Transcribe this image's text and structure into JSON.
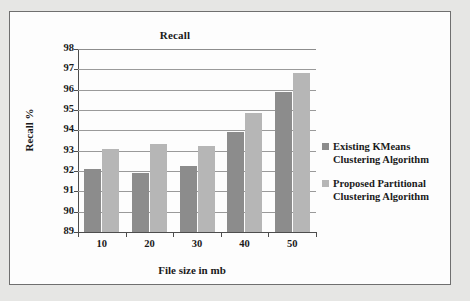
{
  "chart_data": {
    "type": "bar",
    "title": "Recall",
    "xlabel": "File size in mb",
    "ylabel": "Recall %",
    "categories": [
      "10",
      "20",
      "30",
      "40",
      "50"
    ],
    "ylim": [
      89,
      98
    ],
    "yticks": [
      "98",
      "97",
      "96",
      "95",
      "94",
      "93",
      "92",
      "91",
      "90",
      "89"
    ],
    "grid": true,
    "legend_position": "right",
    "series": [
      {
        "name": "Existing KMeans Clustering Algorithm",
        "color": "#8c8c8c",
        "values": [
          92.1,
          91.9,
          92.25,
          93.9,
          95.9
        ]
      },
      {
        "name": "Proposed Partitional Clustering Algorithm",
        "color": "#b6b6b6",
        "values": [
          93.1,
          93.35,
          93.25,
          94.85,
          96.8
        ]
      }
    ]
  },
  "legend": {
    "entries": [
      "Existing KMeans Clustering Algorithm",
      "Proposed Partitional Clustering Algorithm"
    ]
  }
}
